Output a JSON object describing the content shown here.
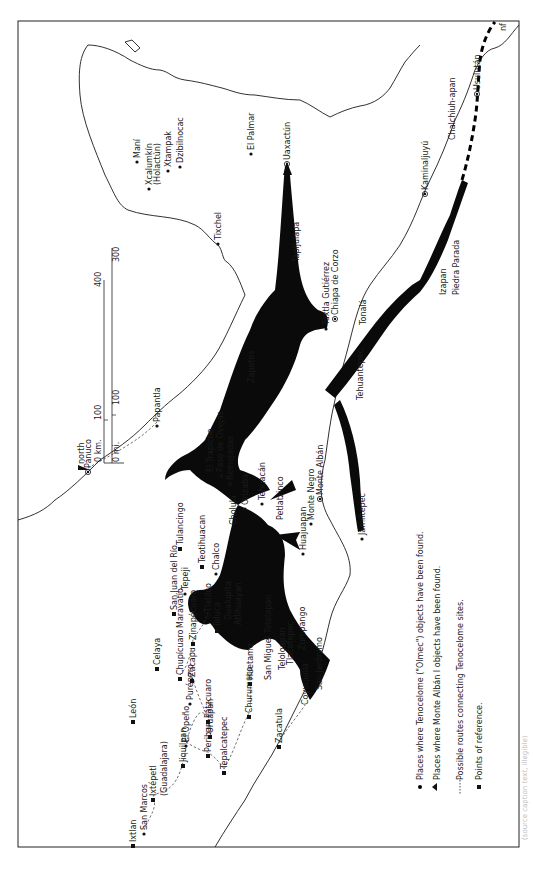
{
  "map": {
    "orientation": "rotated 90 degrees clockwise; north points left",
    "north_label": "north",
    "frame": {
      "x": 18,
      "y": 21,
      "width": 501,
      "height": 826
    }
  },
  "scale_bar": {
    "km_label": "0 km.",
    "mi_label": "0 mi.",
    "km_ticks": [
      "100",
      "400"
    ],
    "mi_ticks": [
      "100",
      "300"
    ]
  },
  "legend": {
    "items": [
      {
        "symbol": "circle",
        "text": "Places where Tenocelome (\"Olmec\") objects have been found."
      },
      {
        "symbol": "triangle",
        "text": "Places where Monte Albán I objects have been found."
      },
      {
        "symbol": "dashed-line",
        "text": "Possible routes connecting Tenocelome sites."
      },
      {
        "symbol": "square",
        "text": "Points of reference."
      }
    ]
  },
  "places": [
    {
      "name": "Maní",
      "x": 137,
      "y": 158,
      "type": "dot"
    },
    {
      "name": "Xcalumkín",
      "x": 149,
      "y": 185,
      "type": "dot"
    },
    {
      "name": "(Holactún)",
      "x": 157,
      "y": 185,
      "type": "none"
    },
    {
      "name": "Xtampak",
      "x": 168,
      "y": 167,
      "type": "dot"
    },
    {
      "name": "Dzibilnocac",
      "x": 180,
      "y": 163,
      "type": "dot"
    },
    {
      "name": "El Palmar",
      "x": 251,
      "y": 150,
      "type": "dot"
    },
    {
      "name": "Uaxactún",
      "x": 287,
      "y": 160,
      "type": "circled-dot"
    },
    {
      "name": "Tixchel",
      "x": 218,
      "y": 240,
      "type": "dot"
    },
    {
      "name": "Tapijulapa",
      "x": 296,
      "y": 262,
      "type": "none"
    },
    {
      "name": "Tuxtla Gutiérrez",
      "x": 326,
      "y": 325,
      "type": "dot"
    },
    {
      "name": "Chiapa de Corzo",
      "x": 335,
      "y": 315,
      "type": "circled-dot"
    },
    {
      "name": "Tonalá",
      "x": 363,
      "y": 325,
      "type": "none"
    },
    {
      "name": "Kaminaljuyú",
      "x": 425,
      "y": 190,
      "type": "circled-dot"
    },
    {
      "name": "Chalchiuh-apan",
      "x": 452,
      "y": 140,
      "type": "none"
    },
    {
      "name": "Usulután",
      "x": 477,
      "y": 90,
      "type": "circled-dot"
    },
    {
      "name": "nf",
      "x": 503,
      "y": 31,
      "type": "none"
    },
    {
      "name": "Izapan",
      "x": 443,
      "y": 295,
      "type": "none"
    },
    {
      "name": "Piedra Parada",
      "x": 456,
      "y": 295,
      "type": "none"
    },
    {
      "name": "Zapotes",
      "x": 251,
      "y": 383,
      "type": "none"
    },
    {
      "name": "El Trapiche",
      "x": 210,
      "y": 472,
      "type": "none"
    },
    {
      "name": "Paso de Ovejas",
      "x": 220,
      "y": 472,
      "type": "triangle"
    },
    {
      "name": "Remojadas",
      "x": 230,
      "y": 480,
      "type": "square"
    },
    {
      "name": "Monte Negro",
      "x": 311,
      "y": 520,
      "type": "dot"
    },
    {
      "name": "Monte Albán",
      "x": 320,
      "y": 495,
      "type": "circled-dot"
    },
    {
      "name": "Tehuantepec",
      "x": 360,
      "y": 400,
      "type": "none"
    },
    {
      "name": "Jamiltepec",
      "x": 362,
      "y": 535,
      "type": "dot"
    },
    {
      "name": "Huajuapan",
      "x": 303,
      "y": 550,
      "type": "dot"
    },
    {
      "name": "Petlatzinco",
      "x": 280,
      "y": 520,
      "type": "none"
    },
    {
      "name": "Tehuacán",
      "x": 262,
      "y": 500,
      "type": "dot"
    },
    {
      "name": "Orizaba",
      "x": 245,
      "y": 505,
      "type": "dot"
    },
    {
      "name": "Cholula",
      "x": 233,
      "y": 525,
      "type": "none"
    },
    {
      "name": "Papantla",
      "x": 157,
      "y": 422,
      "type": "dot"
    },
    {
      "name": "Pánuco",
      "x": 88,
      "y": 468,
      "type": "circled-dot"
    },
    {
      "name": "Tulancingo",
      "x": 180,
      "y": 545,
      "type": "square"
    },
    {
      "name": "Teotihuacan",
      "x": 202,
      "y": 563,
      "type": "square"
    },
    {
      "name": "Tepeji",
      "x": 185,
      "y": 590,
      "type": "dot"
    },
    {
      "name": "Chalco",
      "x": 216,
      "y": 570,
      "type": "dot"
    },
    {
      "name": "San Juan del Río",
      "x": 174,
      "y": 610,
      "type": "square"
    },
    {
      "name": "Maravatío",
      "x": 180,
      "y": 628,
      "type": "none"
    },
    {
      "name": "Tlatilco",
      "x": 208,
      "y": 612,
      "type": "circled-dot"
    },
    {
      "name": "Zinapécuaro",
      "x": 193,
      "y": 640,
      "type": "square"
    },
    {
      "name": "Toluca",
      "x": 217,
      "y": 627,
      "type": "square"
    },
    {
      "name": "Gualupita",
      "x": 228,
      "y": 620,
      "type": "none"
    },
    {
      "name": "Atlihuayan",
      "x": 238,
      "y": 625,
      "type": "none"
    },
    {
      "name": "Celaya",
      "x": 157,
      "y": 665,
      "type": "square"
    },
    {
      "name": "León",
      "x": 133,
      "y": 718,
      "type": "square"
    },
    {
      "name": "Chupícuaro",
      "x": 180,
      "y": 675,
      "type": "square"
    },
    {
      "name": "Purépero",
      "x": 190,
      "y": 700,
      "type": "dot"
    },
    {
      "name": "Zacapu",
      "x": 192,
      "y": 677,
      "type": "square"
    },
    {
      "name": "Pátzcuaro",
      "x": 208,
      "y": 718,
      "type": "square"
    },
    {
      "name": "Uruapan",
      "x": 210,
      "y": 733,
      "type": "square"
    },
    {
      "name": "Huetamo",
      "x": 250,
      "y": 680,
      "type": "square"
    },
    {
      "name": "San Miguel Totolapan",
      "x": 268,
      "y": 680,
      "type": "none"
    },
    {
      "name": "Teloloapan",
      "x": 282,
      "y": 670,
      "type": "none"
    },
    {
      "name": "Tlacotepec",
      "x": 290,
      "y": 665,
      "type": "none"
    },
    {
      "name": "Zumpango",
      "x": 302,
      "y": 650,
      "type": "none"
    },
    {
      "name": "San Jerónimo",
      "x": 319,
      "y": 690,
      "type": "none"
    },
    {
      "name": "Coyuquilla",
      "x": 305,
      "y": 705,
      "type": "none"
    },
    {
      "name": "Churumuco",
      "x": 249,
      "y": 713,
      "type": "square"
    },
    {
      "name": "Zacatula",
      "x": 279,
      "y": 743,
      "type": "square"
    },
    {
      "name": "Tepalcatepec",
      "x": 224,
      "y": 769,
      "type": "square"
    },
    {
      "name": "Periban",
      "x": 208,
      "y": 752,
      "type": "square"
    },
    {
      "name": "El Opeño",
      "x": 186,
      "y": 742,
      "type": "dot"
    },
    {
      "name": "Jiquilpan",
      "x": 183,
      "y": 762,
      "type": "square"
    },
    {
      "name": "Ixtépetl",
      "x": 153,
      "y": 796,
      "type": "square"
    },
    {
      "name": "(Guadalajara)",
      "x": 164,
      "y": 796,
      "type": "none"
    },
    {
      "name": "San Marcos",
      "x": 144,
      "y": 830,
      "type": "dot"
    },
    {
      "name": "Ixtlan",
      "x": 133,
      "y": 842,
      "type": "square"
    }
  ],
  "caption": "(source caption text, illegible)"
}
